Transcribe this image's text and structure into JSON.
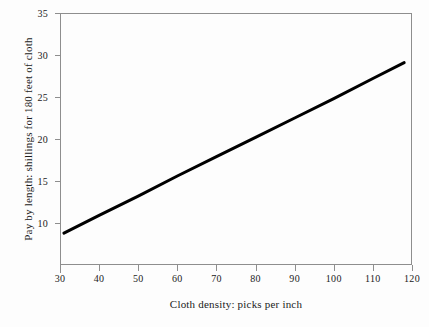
{
  "chart_data": {
    "type": "line",
    "title": "",
    "xlabel": "Cloth density: picks per inch",
    "ylabel": "Pay by length: shillings for 180 feet of cloth",
    "xlim": [
      30,
      120
    ],
    "ylim": [
      5,
      35
    ],
    "grid": false,
    "legend": null,
    "xticks": [
      30,
      40,
      50,
      60,
      70,
      80,
      90,
      100,
      110,
      120
    ],
    "xticklabels": [
      "30",
      "40",
      "50",
      "60",
      "70",
      "80",
      "90",
      "100",
      "110",
      "120"
    ],
    "yticks": [
      10,
      15,
      20,
      25,
      30,
      35
    ],
    "yticklabels": [
      "10",
      "15",
      "20",
      "25",
      "30",
      "35"
    ],
    "series": [
      {
        "name": "Pay by length",
        "color": "#000000",
        "linewidth": 3,
        "x": [
          31,
          40,
          50,
          60,
          70,
          80,
          90,
          100,
          110,
          118
        ],
        "values": [
          8.8,
          10.9,
          13.2,
          15.6,
          17.9,
          20.2,
          22.5,
          24.8,
          27.2,
          29.1
        ]
      }
    ],
    "axis_color": "#8e8e8e",
    "background": "#fdfdfd"
  }
}
